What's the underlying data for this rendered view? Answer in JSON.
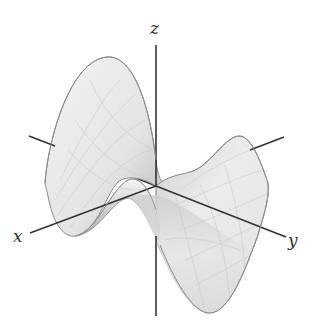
{
  "figure": {
    "surface_type": "saddle",
    "colors": {
      "background": "#ffffff",
      "axis": "#333333",
      "surface_fill": "#ececec",
      "surface_shade": "#bdbdbd",
      "surface_edge": "#8a8a8a",
      "grid": "#d2d2d2"
    }
  },
  "axes": {
    "x": {
      "label": "x"
    },
    "y": {
      "label": "y"
    },
    "z": {
      "label": "z"
    }
  }
}
